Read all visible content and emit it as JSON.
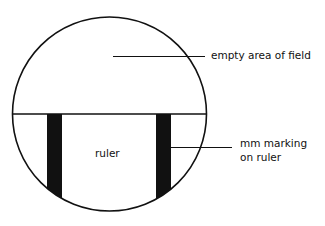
{
  "diagram": {
    "labels": {
      "empty_area": "empty area of field",
      "ruler": "ruler",
      "mm_marking_line1": "mm marking",
      "mm_marking_line2": "on ruler"
    },
    "colors": {
      "stroke": "#111111",
      "background": "#ffffff"
    }
  }
}
